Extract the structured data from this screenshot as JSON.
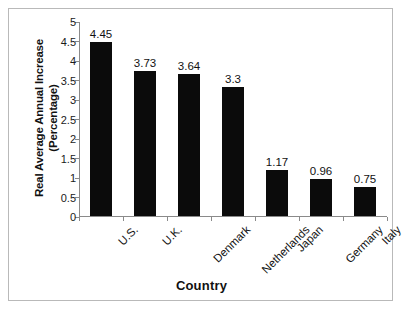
{
  "chart_data": {
    "type": "bar",
    "title": "",
    "categories": [
      "U.S.",
      "U.K.",
      "Denmark",
      "Netherlands",
      "Japan",
      "Germany",
      "Italy"
    ],
    "values": [
      4.45,
      3.73,
      3.64,
      3.3,
      1.17,
      0.96,
      0.75
    ],
    "value_labels": [
      "4.45",
      "3.73",
      "3.64",
      "3.3",
      "1.17",
      "0.96",
      "0.75"
    ],
    "xlabel": "Country",
    "ylabel": "Real Average Annual Increase (Percentage)",
    "ylabel_line1": "Real Average Annual Increase",
    "ylabel_line2": "(Percentage)",
    "ylim": [
      0,
      5
    ],
    "ytick_labels": [
      "0",
      "0.5",
      "1",
      "1.5",
      "2",
      "2.5",
      "3",
      "3.5",
      "4",
      "4.5",
      "5"
    ],
    "ytick_values": [
      0,
      0.5,
      1,
      1.5,
      2,
      2.5,
      3,
      3.5,
      4,
      4.5,
      5
    ],
    "grid": false,
    "legend": false,
    "bar_color": "#0b0b0b",
    "axis_color": "#8a8a8a",
    "background_color": "#ffffff",
    "xtick_label_rotation": -45
  }
}
